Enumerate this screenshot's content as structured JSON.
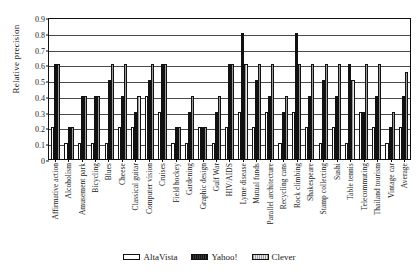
{
  "chart_data": {
    "type": "bar",
    "title": "",
    "xlabel": "",
    "ylabel": "Relative precision",
    "ylim": [
      0,
      0.9
    ],
    "yticks": [
      "0",
      "0.1",
      "0.2",
      "0.3",
      "0.4",
      "0.5",
      "0.6",
      "0.7",
      "0.8",
      "0.9"
    ],
    "ytick_values": [
      0,
      0.1,
      0.2,
      0.3,
      0.4,
      0.5,
      0.6,
      0.7,
      0.8,
      0.9
    ],
    "grid": true,
    "legend_position": "bottom",
    "categories": [
      "Affirmative action",
      "Alcoholism",
      "Amusement park",
      "Bicycling",
      "Blues",
      "Cheese",
      "Classical guitar",
      "Computer vision",
      "Cruises",
      "Field hockey",
      "Gardening",
      "Graphic design",
      "Gulf War",
      "HIV/AIDS",
      "Lyme disease",
      "Mutual funds",
      "Parallel architecture",
      "Recycling cans",
      "Rock climbing",
      "Shakespeare",
      "Stamp collecting",
      "Sushi",
      "Table tennis",
      "Telecommuting",
      "Thailand tourism",
      "Vintage car",
      "Average"
    ],
    "series": [
      {
        "name": "AltaVista",
        "color": "#ffffff",
        "values": [
          0.2,
          0.1,
          0.1,
          0.1,
          0.1,
          0.2,
          0.2,
          0.4,
          0.3,
          0.1,
          0.1,
          0.2,
          0.1,
          0.2,
          0.3,
          0.2,
          0.3,
          0.1,
          0.3,
          0.2,
          0.1,
          0.2,
          0.1,
          0.3,
          0.2,
          0.1,
          0.2
        ]
      },
      {
        "name": "Yahoo!",
        "color": "#1d1d1d",
        "values": [
          0.6,
          0.2,
          0.4,
          0.4,
          0.5,
          0.4,
          0.3,
          0.5,
          0.6,
          0.2,
          0.3,
          0.2,
          0.3,
          0.6,
          0.8,
          0.5,
          0.4,
          0.3,
          0.8,
          0.4,
          0.5,
          0.4,
          0.6,
          0.3,
          0.4,
          0.2,
          0.4
        ]
      },
      {
        "name": "Clever",
        "color": "#bdbdbd",
        "values": [
          0.6,
          0.2,
          0.4,
          0.4,
          0.6,
          0.6,
          0.4,
          0.6,
          0.6,
          0.2,
          0.4,
          0.2,
          0.4,
          0.6,
          0.6,
          0.6,
          0.6,
          0.4,
          0.6,
          0.6,
          0.6,
          0.6,
          0.5,
          0.6,
          0.6,
          0.3,
          0.55
        ]
      }
    ]
  }
}
